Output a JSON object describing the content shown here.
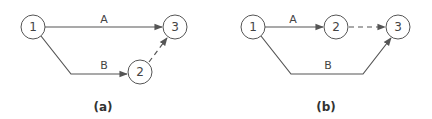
{
  "diagrams": [
    {
      "caption": "(a)",
      "nodes": [
        {
          "label": "1",
          "x": 33,
          "y": 27
        },
        {
          "label": "2",
          "x": 140,
          "y": 72
        },
        {
          "label": "3",
          "x": 175,
          "y": 27
        }
      ],
      "edges": [
        {
          "label": "A",
          "from": "1",
          "to": "3",
          "style": "solid"
        },
        {
          "label": "B",
          "from": "1",
          "to": "2",
          "style": "solid"
        },
        {
          "label": "",
          "from": "2",
          "to": "3",
          "style": "dashed"
        }
      ]
    },
    {
      "caption": "(b)",
      "nodes": [
        {
          "label": "1",
          "x": 253,
          "y": 27
        },
        {
          "label": "2",
          "x": 336,
          "y": 27
        },
        {
          "label": "3",
          "x": 398,
          "y": 27
        }
      ],
      "edges": [
        {
          "label": "A",
          "from": "1",
          "to": "2",
          "style": "solid"
        },
        {
          "label": "",
          "from": "2",
          "to": "3",
          "style": "dashed"
        },
        {
          "label": "B",
          "from": "1",
          "to": "3",
          "style": "solid"
        }
      ]
    }
  ]
}
